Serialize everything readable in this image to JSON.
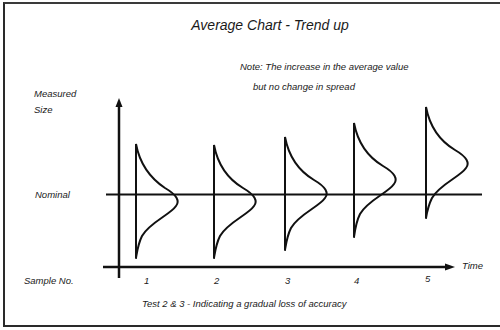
{
  "diagram": {
    "title": "Average Chart - Trend up",
    "note_line1": "Note: The increase in the average value",
    "note_line2": "but no change in spread",
    "y_axis_label_line1": "Measured",
    "y_axis_label_line2": "Size",
    "nominal_label": "Nominal",
    "x_axis_label": "Time",
    "sample_label": "Sample No.",
    "sample_numbers": [
      "1",
      "2",
      "3",
      "4",
      "5"
    ],
    "caption": "Test 2 & 3 - Indicating a gradual loss of accuracy",
    "distributions": [
      {
        "sample": "1",
        "mean_offset_from_nominal": "below (slightly)",
        "spread": "constant"
      },
      {
        "sample": "2",
        "mean_offset_from_nominal": "below (slightly)",
        "spread": "constant"
      },
      {
        "sample": "3",
        "mean_offset_from_nominal": "at nominal",
        "spread": "constant"
      },
      {
        "sample": "4",
        "mean_offset_from_nominal": "above",
        "spread": "constant"
      },
      {
        "sample": "5",
        "mean_offset_from_nominal": "further above",
        "spread": "constant"
      }
    ],
    "line_color": "#111111"
  }
}
